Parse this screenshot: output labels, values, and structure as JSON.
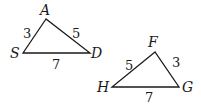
{
  "triangles": [
    {
      "name": "ASD",
      "vertices": {
        "A": [
          46,
          19
        ],
        "S": [
          23,
          53
        ],
        "D": [
          90,
          53
        ]
      },
      "labels": {
        "A": "A",
        "S": "S",
        "D": "D"
      },
      "sides": {
        "AS": "3",
        "AD": "5",
        "SD": "7"
      }
    },
    {
      "name": "FHG",
      "vertices": {
        "F": [
          155,
          52
        ],
        "H": [
          112,
          87
        ],
        "G": [
          179,
          87
        ]
      },
      "labels": {
        "F": "F",
        "H": "H",
        "G": "G"
      },
      "sides": {
        "FH": "5",
        "FG": "3",
        "HG": "7"
      }
    }
  ],
  "colors": {
    "stroke": "#1a1a1a",
    "background": "#ffffff"
  }
}
